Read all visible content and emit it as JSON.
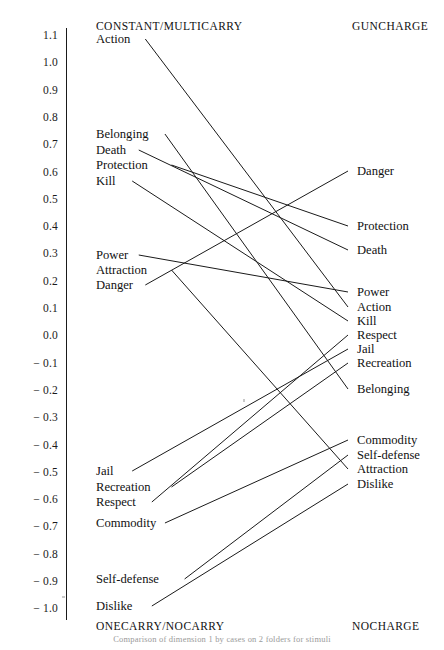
{
  "figure": {
    "caption_fragment": "Comparison of dimension 1 by cases on 2 folders for stimuli",
    "left_header_top": "CONSTANT/MULTICARRY",
    "left_header_bottom": "ONECARRY/NOCARRY",
    "right_header_top": "GUNCHARGE",
    "right_header_bottom": "NOCHARGE",
    "line_color": "#1a1a1a",
    "axis_color": "#1a1a1a"
  },
  "axis": {
    "ticks": [
      {
        "label": "1.1",
        "value": 1.1
      },
      {
        "label": "1.0",
        "value": 1.0
      },
      {
        "label": "0.9",
        "value": 0.9
      },
      {
        "label": "0.8",
        "value": 0.8
      },
      {
        "label": "0.7",
        "value": 0.7
      },
      {
        "label": "0.6",
        "value": 0.6
      },
      {
        "label": "0.5",
        "value": 0.5
      },
      {
        "label": "0.4",
        "value": 0.4
      },
      {
        "label": "0.3",
        "value": 0.3
      },
      {
        "label": "0.2",
        "value": 0.2
      },
      {
        "label": "0.1",
        "value": 0.1
      },
      {
        "label": "0.0",
        "value": 0.0
      },
      {
        "label": "− 0.1",
        "value": -0.1
      },
      {
        "label": "− 0.2",
        "value": -0.2
      },
      {
        "label": "− 0.3",
        "value": -0.3
      },
      {
        "label": "− 0.4",
        "value": -0.4
      },
      {
        "label": "− 0.5",
        "value": -0.5
      },
      {
        "label": "− 0.6",
        "value": -0.6
      },
      {
        "label": "− 0.7",
        "value": -0.7
      },
      {
        "label": "− 0.8",
        "value": -0.8
      },
      {
        "label": "− 0.9",
        "value": -0.9
      },
      {
        "label": "− 1.0",
        "value": -1.0
      }
    ]
  },
  "chart_data": {
    "type": "line",
    "title": "",
    "subtitle": "",
    "xlabel": "",
    "ylabel": "",
    "ylim": [
      -1.05,
      1.15
    ],
    "grid": false,
    "legend": "none",
    "categories": [
      "CONSTANT/MULTICARRY – ONECARRY/NOCARRY",
      "GUNCHARGE – NOCHARGE"
    ],
    "x": [
      0,
      1
    ],
    "series": [
      {
        "name": "Action",
        "values": [
          1.1,
          0.1
        ]
      },
      {
        "name": "Belonging",
        "values": [
          0.72,
          -0.2
        ]
      },
      {
        "name": "Death",
        "values": [
          0.66,
          0.31
        ]
      },
      {
        "name": "Protection",
        "values": [
          0.61,
          0.4
        ]
      },
      {
        "name": "Kill",
        "values": [
          0.55,
          0.05
        ]
      },
      {
        "name": "Power",
        "values": [
          0.29,
          0.15
        ]
      },
      {
        "name": "Attraction",
        "values": [
          0.23,
          -0.49
        ]
      },
      {
        "name": "Danger",
        "values": [
          0.18,
          0.6
        ]
      },
      {
        "name": "Jail",
        "values": [
          -0.5,
          -0.05
        ]
      },
      {
        "name": "Recreation",
        "values": [
          -0.56,
          -0.11
        ]
      },
      {
        "name": "Respect",
        "values": [
          -0.62,
          0.0
        ]
      },
      {
        "name": "Commodity",
        "values": [
          -0.7,
          -0.39
        ]
      },
      {
        "name": "Self-defense",
        "values": [
          -0.9,
          -0.45
        ]
      },
      {
        "name": "Dislike",
        "values": [
          -1.0,
          -0.55
        ]
      }
    ]
  },
  "left_labels": [
    {
      "text": "Action",
      "y": 42
    },
    {
      "text": "Belonging",
      "y": 137
    },
    {
      "text": "Death",
      "y": 153
    },
    {
      "text": "Protection",
      "y": 168
    },
    {
      "text": "Kill",
      "y": 184
    },
    {
      "text": "Power",
      "y": 258
    },
    {
      "text": "Attraction",
      "y": 273
    },
    {
      "text": "Danger",
      "y": 288
    },
    {
      "text": "Jail",
      "y": 474
    },
    {
      "text": "Recreation",
      "y": 490
    },
    {
      "text": "Respect",
      "y": 505
    },
    {
      "text": "Commodity",
      "y": 526
    },
    {
      "text": "Self-defense",
      "y": 582
    },
    {
      "text": "Dislike",
      "y": 609
    }
  ],
  "right_labels": [
    {
      "text": "Danger",
      "y": 174
    },
    {
      "text": "Protection",
      "y": 229
    },
    {
      "text": "Death",
      "y": 253
    },
    {
      "text": "Power",
      "y": 295
    },
    {
      "text": "Action",
      "y": 310
    },
    {
      "text": "Kill",
      "y": 324
    },
    {
      "text": "Respect",
      "y": 338
    },
    {
      "text": "Jail",
      "y": 352
    },
    {
      "text": "Recreation",
      "y": 366
    },
    {
      "text": "Belonging",
      "y": 392
    },
    {
      "text": "Commodity",
      "y": 443
    },
    {
      "text": "Self-defense",
      "y": 458
    },
    {
      "text": "Attraction",
      "y": 472
    },
    {
      "text": "Dislike",
      "y": 487
    }
  ],
  "connections": [
    {
      "name": "Action",
      "y1": 42,
      "y2": 310
    },
    {
      "name": "Belonging",
      "y1": 137,
      "y2": 392
    },
    {
      "name": "Death",
      "y1": 153,
      "y2": 253
    },
    {
      "name": "Protection",
      "y1": 168,
      "y2": 229
    },
    {
      "name": "Kill",
      "y1": 184,
      "y2": 324
    },
    {
      "name": "Power",
      "y1": 258,
      "y2": 295
    },
    {
      "name": "Attraction",
      "y1": 273,
      "y2": 472
    },
    {
      "name": "Danger",
      "y1": 288,
      "y2": 174
    },
    {
      "name": "Jail",
      "y1": 474,
      "y2": 352
    },
    {
      "name": "Recreation",
      "y1": 490,
      "y2": 366
    },
    {
      "name": "Respect",
      "y1": 505,
      "y2": 338
    },
    {
      "name": "Commodity",
      "y1": 526,
      "y2": 443
    },
    {
      "name": "Self-defense",
      "y1": 582,
      "y2": 458
    },
    {
      "name": "Dislike",
      "y1": 609,
      "y2": 487
    }
  ]
}
